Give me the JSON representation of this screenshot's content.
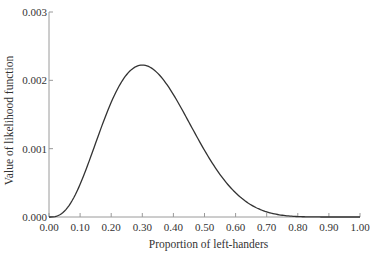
{
  "chart_data": {
    "type": "line",
    "title": "",
    "xlabel": "Proportion of left-handers",
    "ylabel": "Value of likelihood function",
    "xlim": [
      0,
      1
    ],
    "ylim": [
      0,
      0.003
    ],
    "x_ticks": [
      "0.00",
      "0.10",
      "0.20",
      "0.30",
      "0.40",
      "0.50",
      "0.60",
      "0.70",
      "0.80",
      "0.90",
      "1.00"
    ],
    "y_ticks": [
      "0.000",
      "0.001",
      "0.002",
      "0.003"
    ],
    "grid": false,
    "series": [
      {
        "name": "likelihood",
        "description": "p^3 (1-p)^7",
        "x": [
          0.0,
          0.05,
          0.1,
          0.15,
          0.2,
          0.25,
          0.3,
          0.35,
          0.4,
          0.45,
          0.5,
          0.55,
          0.6,
          0.65,
          0.7,
          0.75,
          0.8,
          0.85,
          0.9,
          0.95,
          1.0
        ],
        "values": [
          0.0,
          8.7e-05,
          0.000478,
          0.000962,
          0.001342,
          0.001564,
          0.002224,
          0.002098,
          0.001792,
          0.001392,
          0.000977,
          0.000622,
          0.000354,
          0.000177,
          7.6e-05,
          2.6e-05,
          7e-06,
          1e-06,
          0.0,
          0.0,
          0.0
        ]
      }
    ]
  }
}
